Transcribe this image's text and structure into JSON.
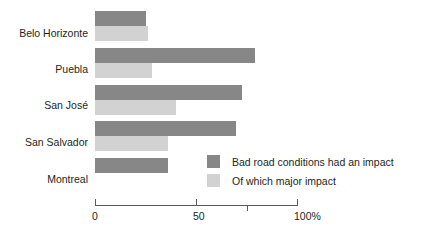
{
  "chart_data": {
    "type": "bar",
    "orientation": "horizontal",
    "title": "",
    "xlabel": "",
    "ylabel": "",
    "xlim": [
      0,
      100
    ],
    "grid": false,
    "legend_position": "inside-bottom-right",
    "categories": [
      "Belo Horizonte",
      "Puebla",
      "San José",
      "San Salvador",
      "Montreal"
    ],
    "series": [
      {
        "name": "Bad road conditions had an impact",
        "color": "#878787",
        "values": [
          25,
          79,
          73,
          70,
          36
        ]
      },
      {
        "name": "Of which major impact",
        "color": "#d2d2d2",
        "values": [
          26,
          28,
          40,
          36,
          0
        ]
      }
    ],
    "axis": {
      "ticks": [
        {
          "value": 0,
          "label": "0",
          "style": "end"
        },
        {
          "value": 50,
          "label": "50",
          "style": "end"
        },
        {
          "value": 75,
          "label": "",
          "style": "mid"
        },
        {
          "value": 100,
          "label": "100%",
          "style": "end"
        }
      ]
    }
  }
}
